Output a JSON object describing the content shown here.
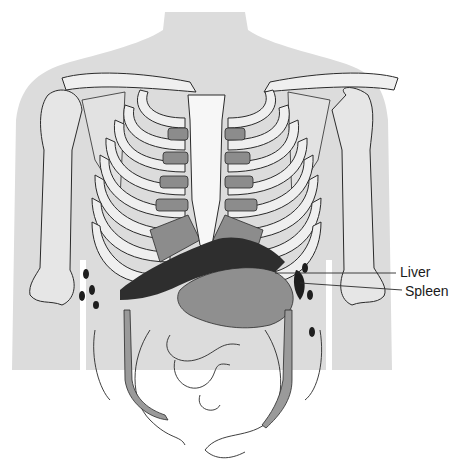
{
  "figure": {
    "labels": [
      {
        "id": "liver",
        "text": "Liver",
        "x": 400,
        "y": 262,
        "target": [
          275,
          272
        ]
      },
      {
        "id": "spleen",
        "text": "Spleen",
        "x": 405,
        "y": 283,
        "target": [
          300,
          283
        ]
      }
    ]
  },
  "colors": {
    "body_silhouette": "#dcdcdc",
    "bone_fill": "#efefef",
    "cartilage": "#8c8c8c",
    "liver": "#2e2e2e",
    "stomach": "#8f8f8f",
    "outline": "#2a2a2a",
    "sternum": "#f7f7f7"
  }
}
